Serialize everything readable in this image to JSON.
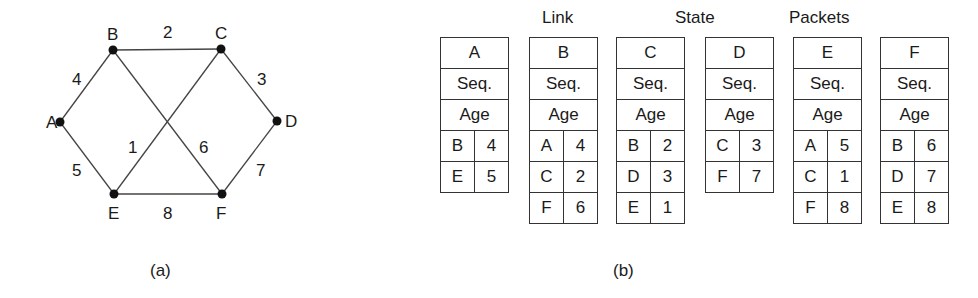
{
  "graph": {
    "nodes": [
      {
        "id": "A",
        "x": 60,
        "y": 122,
        "label_dx": -14,
        "label_dy": 6
      },
      {
        "id": "B",
        "x": 113,
        "y": 50,
        "label_dx": -6,
        "label_dy": -10
      },
      {
        "id": "C",
        "x": 221,
        "y": 49,
        "label_dx": -6,
        "label_dy": -10
      },
      {
        "id": "D",
        "x": 277,
        "y": 121,
        "label_dx": 8,
        "label_dy": 6
      },
      {
        "id": "E",
        "x": 114,
        "y": 194,
        "label_dx": -6,
        "label_dy": 25
      },
      {
        "id": "F",
        "x": 222,
        "y": 194,
        "label_dx": -6,
        "label_dy": 25
      }
    ],
    "edges": [
      {
        "from": "A",
        "to": "B",
        "weight": "4",
        "lx": 72,
        "ly": 85
      },
      {
        "from": "B",
        "to": "C",
        "weight": "2",
        "lx": 163,
        "ly": 38
      },
      {
        "from": "C",
        "to": "D",
        "weight": "3",
        "lx": 257,
        "ly": 85
      },
      {
        "from": "A",
        "to": "E",
        "weight": "5",
        "lx": 72,
        "ly": 176
      },
      {
        "from": "E",
        "to": "C",
        "weight": "1",
        "lx": 128,
        "ly": 153
      },
      {
        "from": "B",
        "to": "F",
        "weight": "6",
        "lx": 199,
        "ly": 153
      },
      {
        "from": "D",
        "to": "F",
        "weight": "7",
        "lx": 256,
        "ly": 176
      },
      {
        "from": "E",
        "to": "F",
        "weight": "8",
        "lx": 163,
        "ly": 219
      }
    ]
  },
  "captions": {
    "a": "(a)",
    "b": "(b)"
  },
  "header_words": [
    {
      "text": "Link",
      "x": 542
    },
    {
      "text": "State",
      "x": 675
    },
    {
      "text": "Packets",
      "x": 789
    }
  ],
  "packets": [
    {
      "router": "A",
      "seq": "Seq.",
      "age": "Age",
      "left": 440,
      "links": [
        [
          "B",
          "4"
        ],
        [
          "E",
          "5"
        ]
      ]
    },
    {
      "router": "B",
      "seq": "Seq.",
      "age": "Age",
      "left": 529,
      "links": [
        [
          "A",
          "4"
        ],
        [
          "C",
          "2"
        ],
        [
          "F",
          "6"
        ]
      ]
    },
    {
      "router": "C",
      "seq": "Seq.",
      "age": "Age",
      "left": 616,
      "links": [
        [
          "B",
          "2"
        ],
        [
          "D",
          "3"
        ],
        [
          "E",
          "1"
        ]
      ]
    },
    {
      "router": "D",
      "seq": "Seq.",
      "age": "Age",
      "left": 705,
      "links": [
        [
          "C",
          "3"
        ],
        [
          "F",
          "7"
        ]
      ]
    },
    {
      "router": "E",
      "seq": "Seq.",
      "age": "Age",
      "left": 793,
      "links": [
        [
          "A",
          "5"
        ],
        [
          "C",
          "1"
        ],
        [
          "F",
          "8"
        ]
      ]
    },
    {
      "router": "F",
      "seq": "Seq.",
      "age": "Age",
      "left": 880,
      "links": [
        [
          "B",
          "6"
        ],
        [
          "D",
          "7"
        ],
        [
          "E",
          "8"
        ]
      ]
    }
  ]
}
